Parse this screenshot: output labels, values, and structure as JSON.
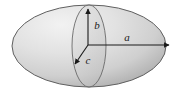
{
  "figure": {
    "name": "ellipsoid-semi-axes-diagram",
    "background_color": "#ffffff",
    "body_fill_light": "#e9e9e9",
    "body_fill_mid": "#d2d2d2",
    "body_fill_dark": "#a6a6a6",
    "outline_color": "#5a5a5a",
    "arrow_color": "#1a1a1a",
    "label_color": "#1a1a1a"
  },
  "outer_ellipse": {
    "name": "ellipsoid-body",
    "center_x": 89,
    "center_y": 46,
    "radius_x": 77,
    "radius_y": 41
  },
  "inner_ellipse": {
    "name": "cross-section-ellipse",
    "center_x": 89,
    "center_y": 46,
    "radius_x": 17,
    "radius_y": 41
  },
  "center_point": {
    "name": "ellipsoid-center",
    "x": 88,
    "y": 45
  },
  "axes": [
    {
      "id": "a",
      "label": "a",
      "name": "semi-axis-a",
      "description": "horizontal semi-axis pointing right",
      "x1": 88,
      "y1": 45,
      "x2": 171,
      "y2": 45,
      "label_x": 127,
      "label_y": 41
    },
    {
      "id": "b",
      "label": "b",
      "name": "semi-axis-b",
      "description": "vertical semi-axis pointing up",
      "x1": 88,
      "y1": 45,
      "x2": 88,
      "y2": 7,
      "label_x": 97,
      "label_y": 29
    },
    {
      "id": "c",
      "label": "c",
      "name": "semi-axis-c",
      "description": "oblique semi-axis pointing down-left toward viewer",
      "x1": 88,
      "y1": 45,
      "x2": 74,
      "y2": 66,
      "label_x": 88,
      "label_y": 63
    }
  ]
}
